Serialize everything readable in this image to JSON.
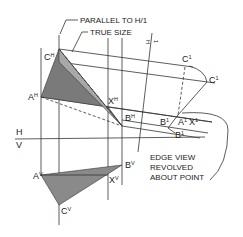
{
  "diagram": {
    "callouts": {
      "parallel": "PARALLEL TO H/1",
      "true_size": "TRUE SIZE",
      "edge_view": [
        "EDGE VIEW",
        "REVOLVED",
        "ABOUT POINT"
      ]
    },
    "fold_lines": {
      "hv_top": "H",
      "hv_bottom": "V",
      "h1_h": "H",
      "h1_1": "1"
    },
    "points": {
      "CH": {
        "base": "C",
        "sup": "H"
      },
      "AH": {
        "base": "A",
        "sup": "H"
      },
      "XH": {
        "base": "X",
        "sup": "H"
      },
      "BH": {
        "base": "B",
        "sup": "H"
      },
      "AV": {
        "base": "A",
        "sup": "V"
      },
      "BV": {
        "base": "B",
        "sup": "V"
      },
      "XV": {
        "base": "X",
        "sup": "V"
      },
      "CV": {
        "base": "C",
        "sup": "V"
      },
      "C1a": {
        "base": "C",
        "sup": "1"
      },
      "C1b": {
        "base": "C",
        "sup": "1"
      },
      "B1a": {
        "base": "B",
        "sup": "1"
      },
      "A1": {
        "base": "A",
        "sup": "1"
      },
      "X1": {
        "base": "X",
        "sup": "1"
      },
      "B1b": {
        "base": "B",
        "sup": "1"
      }
    },
    "colors": {
      "fill_dark": "#7a7a7a",
      "fill_light": "#a8a8a8",
      "line": "#333333"
    }
  }
}
